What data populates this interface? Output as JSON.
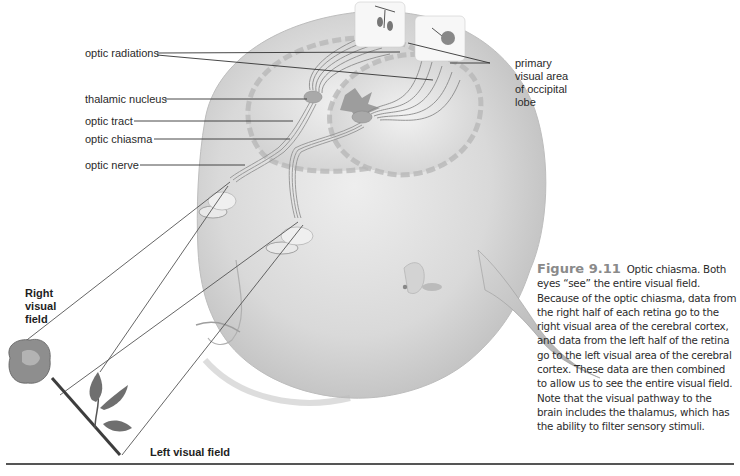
{
  "figure": {
    "number": "Figure 9.11",
    "caption": "Optic chiasma. Both eyes “see” the entire visual field. Because of the optic chiasma, data from the right half of each retina go to the right visual area of the cerebral cortex, and data from the left half of the retina go to the left visual area of the cerebral cortex. These data are then combined to allow us to see the entire visual field. Note that the visual pathway to the brain includes the thalamus, which has the ability to filter sensory stimuli."
  },
  "labels": {
    "optic_radiations": "optic radiations",
    "thalamic_nucleus": "thalamic nucleus",
    "optic_tract": "optic tract",
    "optic_chiasma": "optic chiasma",
    "optic_nerve": "optic nerve",
    "primary_visual_area": [
      "primary",
      "visual area",
      "of occipital",
      "lobe"
    ],
    "right_visual_field": [
      "Right",
      "visual",
      "field"
    ],
    "left_visual_field": "Left visual field"
  },
  "colors": {
    "caption_heading": "#8a8a8a",
    "text": "#2b2b2b",
    "leader_lines": "#333333",
    "illustration_gray": "#cfcfcf"
  }
}
